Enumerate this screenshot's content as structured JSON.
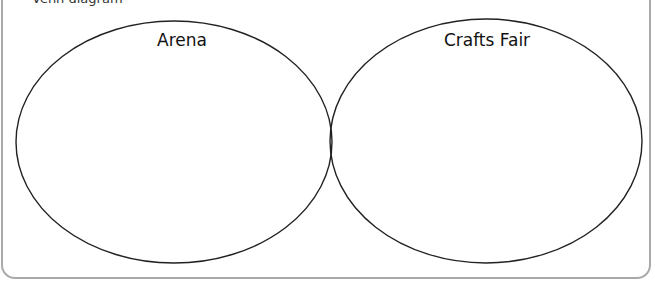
{
  "header": {
    "cut_off_text": "Venn diagram"
  },
  "venn": {
    "stroke_color": "#222222",
    "border_color": "#a9a9a9",
    "sets": [
      {
        "label": "Arena",
        "cx": 174,
        "cy": 142,
        "rx": 158,
        "ry": 121
      },
      {
        "label": "Crafts Fair",
        "cx": 486,
        "cy": 141,
        "rx": 156,
        "ry": 122
      }
    ]
  }
}
